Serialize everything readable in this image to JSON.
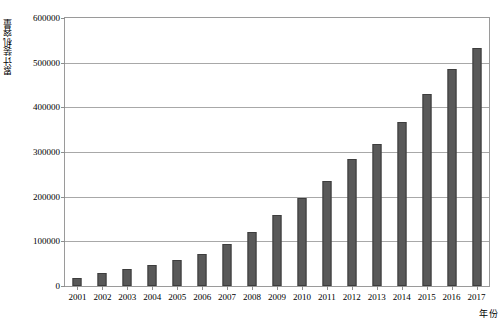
{
  "chart_data": {
    "type": "bar",
    "title": "",
    "xlabel": "年份",
    "ylabel": "累计装机容量",
    "categories": [
      "2001",
      "2002",
      "2003",
      "2004",
      "2005",
      "2006",
      "2007",
      "2008",
      "2009",
      "2010",
      "2011",
      "2012",
      "2013",
      "2014",
      "2015",
      "2016",
      "2017"
    ],
    "values": [
      18000,
      30000,
      38000,
      48000,
      58000,
      72000,
      94000,
      120000,
      159000,
      198000,
      236000,
      284000,
      319000,
      367000,
      430000,
      485000,
      533000
    ],
    "ylim": [
      0,
      600000
    ],
    "ytick_values": [
      0,
      100000,
      200000,
      300000,
      400000,
      500000,
      600000
    ],
    "ytick_labels": [
      "0",
      "100000",
      "200000",
      "300000",
      "400000",
      "500000",
      "600000"
    ],
    "grid": true,
    "legend": null,
    "series_color": "#595959",
    "bar_edge_color": "#3d3d3d",
    "gridline_color": "#a8a8a8",
    "axis_color": "#9a9a9a",
    "background_color": "#ffffff"
  }
}
